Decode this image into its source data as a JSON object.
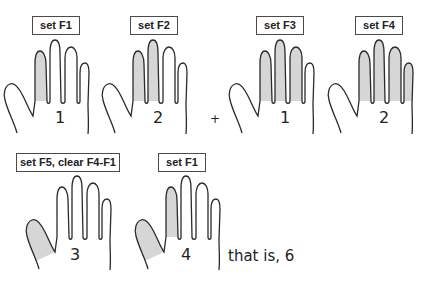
{
  "diagram": {
    "colors": {
      "shade": "#d6d6d6",
      "stroke": "#2a2a2a",
      "box_border": "#4a4a4a"
    },
    "top_row": [
      {
        "label": "set F1",
        "count": "1",
        "shaded": [
          "F1"
        ]
      },
      {
        "label": "set F2",
        "count": "2",
        "shaded": [
          "F1",
          "F2"
        ]
      },
      {
        "label": "set F3",
        "count": "1",
        "shaded": [
          "F1",
          "F2",
          "F3"
        ]
      },
      {
        "label": "set F4",
        "count": "2",
        "shaded": [
          "F1",
          "F2",
          "F3",
          "F4"
        ]
      }
    ],
    "operator": "+",
    "bottom_row": [
      {
        "label": "set F5, clear F4-F1",
        "count": "3",
        "shaded": [
          "F5"
        ]
      },
      {
        "label": "set F1",
        "count": "4",
        "shaded": [
          "F5",
          "F1"
        ]
      }
    ],
    "result_text": "that is, 6"
  }
}
